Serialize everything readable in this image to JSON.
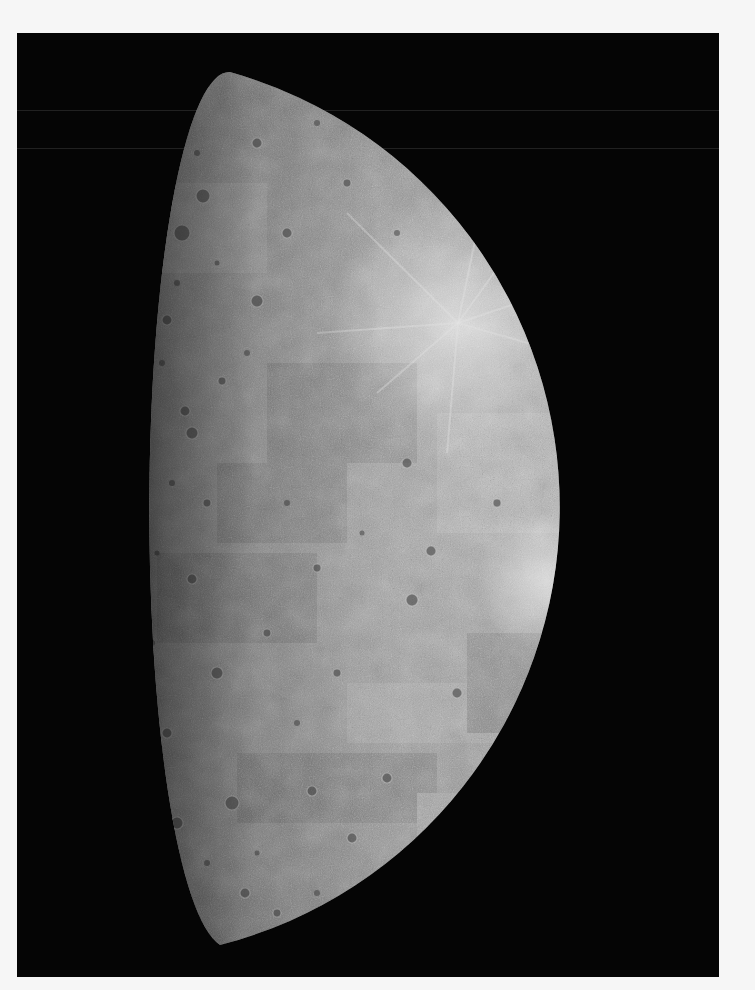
{
  "image": {
    "subject": "Mercury",
    "description": "Grayscale photographic mosaic of a half-illuminated cratered planet against black space",
    "phase": "gibbous, terminator on the left, lit limb on the right",
    "colors": {
      "page_background": "#f6f6f6",
      "space": "#050505",
      "surface_mid": "#8f8f8f",
      "surface_light": "#b8b8b8",
      "surface_dark": "#5e5e5e"
    },
    "frame": {
      "left": 17,
      "top": 33,
      "width": 702,
      "height": 944
    },
    "planet": {
      "limb_center": [
        163,
        477
      ],
      "limb_radius": 452,
      "terminator_rx": 75,
      "top_point": [
        213,
        39
      ],
      "bottom_point": [
        203,
        912
      ],
      "rightmost_x": 616
    },
    "features": {
      "ray_craters": [
        {
          "x": 441,
          "y": 290,
          "r": 5
        },
        {
          "x": 530,
          "y": 548,
          "r": 4
        }
      ],
      "scan_lines_y": [
        77,
        115
      ]
    }
  }
}
